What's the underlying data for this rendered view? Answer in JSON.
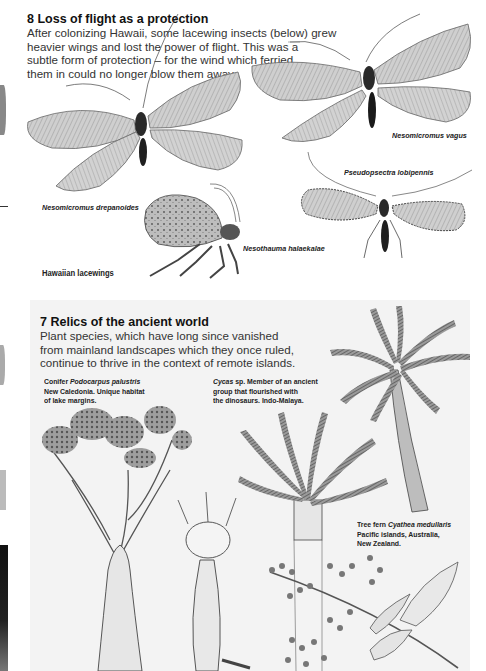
{
  "section8": {
    "title": "8 Loss of flight as a protection",
    "lines": [
      "After colonizing Hawaii, some lacewing insects (below) grew",
      "heavier wings and lost the power of flight. This was a",
      "subtle form of protection – for the wind which ferried",
      "them in could no longer blow them away."
    ],
    "group_label": "Hawaiian lacewings",
    "species": [
      {
        "name": "Nesomicromus drepanoides"
      },
      {
        "name": "Nesomicromus vagus"
      },
      {
        "name": "Pseudopsectra lobipennis"
      },
      {
        "name": "Nesothauma halaekalae"
      }
    ]
  },
  "section7": {
    "title": "7 Relics of the ancient world",
    "lines": [
      "Plant species, which have long since vanished",
      "from mainland landscapes which they once ruled,",
      "continue to thrive in the context of remote islands."
    ],
    "captions": [
      {
        "prefix": "Conifer ",
        "italic": "Podocarpus palustris",
        "line2": "New Caledonia. Unique habitat",
        "line3": "of lake margins."
      },
      {
        "prefix": "",
        "italic": "Cycas",
        "suffix": " sp. Member of an ancient",
        "line2": "group that flourished with",
        "line3": "the dinosaurs. Indo-Malaya."
      },
      {
        "prefix": "Tree fern ",
        "italic": "Cyathea medullaris",
        "line2": "Pacific islands, Australia,",
        "line3": "New Zealand."
      }
    ]
  },
  "colors": {
    "page_bg": "#ffffff",
    "panel_bg": "#f3f3f3",
    "text": "#222222"
  }
}
